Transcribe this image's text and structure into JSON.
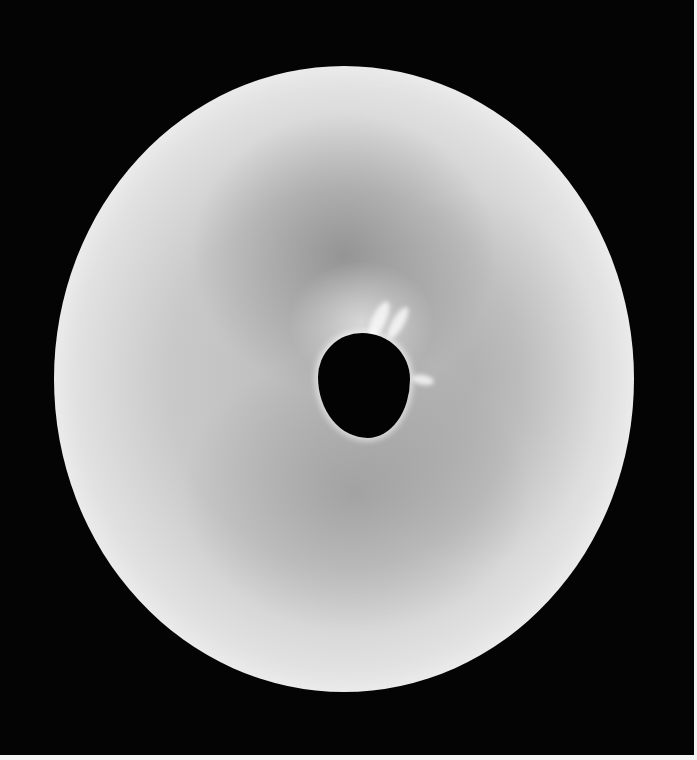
{
  "image": {
    "subject": "perforated disc",
    "description": "Grayscale photograph of a round, pale disc with mottled surface and an irregular central hole, on a black background",
    "colors": {
      "background": "#040404",
      "disc_light": "#efefef",
      "disc_mid": "#b9b9b9",
      "hole": "#030303",
      "border": "#f4f4f4"
    }
  }
}
